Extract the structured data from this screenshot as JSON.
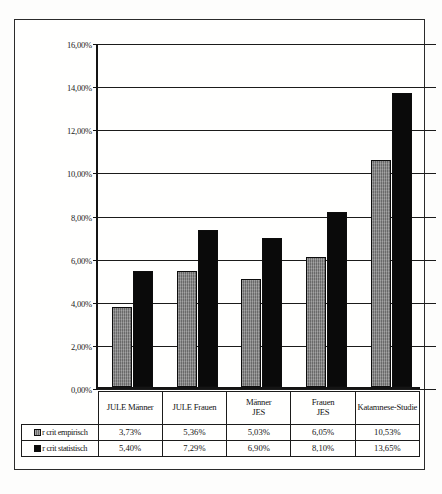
{
  "chart_data": {
    "type": "bar",
    "title": "",
    "xlabel": "",
    "ylabel": "",
    "grid": true,
    "legend_position": "table-left",
    "ylim": [
      0,
      16
    ],
    "yunit": "%",
    "yticks": [
      "0,00%",
      "2,00%",
      "4,00%",
      "6,00%",
      "8,00%",
      "10,00%",
      "12,00%",
      "14,00%",
      "16,00%"
    ],
    "ytick_values": [
      0,
      2,
      4,
      6,
      8,
      10,
      12,
      14,
      16
    ],
    "categories": [
      "JULE Männer",
      "JULE Frauen",
      "Männer\nJES",
      "Frauen\nJES",
      "Katamnese-Studie"
    ],
    "category_lines": [
      [
        "JULE Männer"
      ],
      [
        "JULE Frauen"
      ],
      [
        "Männer",
        "JES"
      ],
      [
        "Frauen",
        "JES"
      ],
      [
        "Katamnese-Studie"
      ]
    ],
    "series": [
      {
        "name": "r crit empirisch",
        "color": "#7e7e7e",
        "values": [
          3.73,
          5.36,
          5.03,
          6.05,
          10.53
        ],
        "labels": [
          "3,73%",
          "5,36%",
          "5,03%",
          "6,05%",
          "10,53%"
        ]
      },
      {
        "name": "r crit statistisch",
        "color": "#0a0a0a",
        "values": [
          5.4,
          7.29,
          6.9,
          8.1,
          13.65
        ],
        "labels": [
          "5,40%",
          "7,29%",
          "6,90%",
          "8,10%",
          "13,65%"
        ]
      }
    ]
  }
}
